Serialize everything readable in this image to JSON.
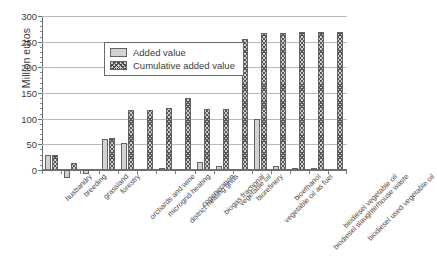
{
  "chart_data": {
    "type": "bar",
    "title": "",
    "xlabel": "",
    "ylabel": "Million euros",
    "ylim": [
      0,
      300
    ],
    "yticks": [
      0,
      50,
      100,
      150,
      200,
      250,
      300
    ],
    "grid": true,
    "legend_position": "top-left-inside",
    "categories": [
      "husbandry",
      "breeding",
      "grassland",
      "forestry",
      "orchards and wine",
      "microgrid heating",
      "district heating grids",
      "cogeneration",
      "biogas fractional",
      "vegetable oil",
      "biorefinery",
      "vegetable oil as fuel",
      "bioethanol",
      "biodiesel slaughterhouse waste",
      "biodiesel vegetable oil",
      "biodiesel used vegetable oil"
    ],
    "series": [
      {
        "name": "Added value",
        "values": [
          30,
          -15,
          -8,
          60,
          53,
          -2,
          3,
          0,
          16,
          7,
          0,
          100,
          8,
          2,
          1,
          0
        ]
      },
      {
        "name": "Cumulative added value",
        "values": [
          30,
          13,
          0,
          63,
          117,
          116,
          120,
          140,
          119,
          119,
          255,
          267,
          267,
          268,
          268,
          268
        ]
      }
    ]
  },
  "legend": {
    "items": [
      {
        "label": "Added value",
        "swatch": "solid-gray"
      },
      {
        "label": "Cumulative added value",
        "swatch": "hatched-gray"
      }
    ]
  }
}
